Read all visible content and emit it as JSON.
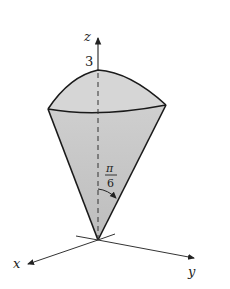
{
  "figure": {
    "axes": {
      "x_label": "x",
      "y_label": "y",
      "z_label": "z"
    },
    "annotations": {
      "z_value": "3",
      "angle_numerator": "π",
      "angle_denominator": "6"
    },
    "colors": {
      "fill": "#d4d4d4",
      "stroke": "#1a1a1a"
    }
  }
}
